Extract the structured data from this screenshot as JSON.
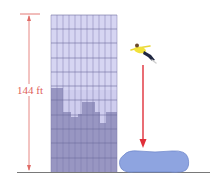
{
  "diagram": {
    "height_label": "144 ft",
    "colors": {
      "dimension": "#e06b66",
      "fall_arrow": "#e0303a",
      "building_light": "#c9c8ea",
      "building_dark": "#8e8cb8",
      "grid": "#7c7aa8",
      "airbag": "#8ea4e0",
      "airbag_edge": "#6f86c8",
      "ground": "#6a6a6a",
      "shirt": "#f2e23a",
      "pants": "#1f2640"
    },
    "elements": [
      "building",
      "height-dimension",
      "jumper",
      "fall-arrow",
      "airbag",
      "ground-line"
    ]
  }
}
